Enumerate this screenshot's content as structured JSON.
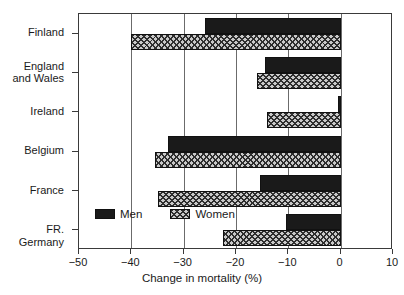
{
  "chart_data": {
    "type": "bar",
    "orientation": "horizontal",
    "title": "",
    "xlabel": "Change in mortality (%)",
    "ylabel": "",
    "xlim": [
      -50,
      10
    ],
    "xticks": [
      -50,
      -40,
      -30,
      -20,
      -10,
      0,
      10
    ],
    "xticklabels": [
      "−50",
      "−40",
      "−30",
      "−20",
      "−10",
      "0",
      "10"
    ],
    "grid": "vertical",
    "legend_position": "inside-lower-left",
    "categories": [
      "Finland",
      "England\nand Wales",
      "Ireland",
      "Belgium",
      "France",
      "FR. Germany"
    ],
    "series": [
      {
        "name": "Men",
        "values": [
          -26.0,
          -14.5,
          -0.5,
          -33.0,
          -15.5,
          -10.5
        ],
        "color": "#1a1a1a",
        "pattern": "solid"
      },
      {
        "name": "Women",
        "values": [
          -40.0,
          -16.0,
          -14.0,
          -35.5,
          -35.0,
          -22.5
        ],
        "color": "#c9c9c9",
        "pattern": "hatched"
      }
    ]
  },
  "legend": {
    "men_label": "Men",
    "women_label": "Women"
  }
}
